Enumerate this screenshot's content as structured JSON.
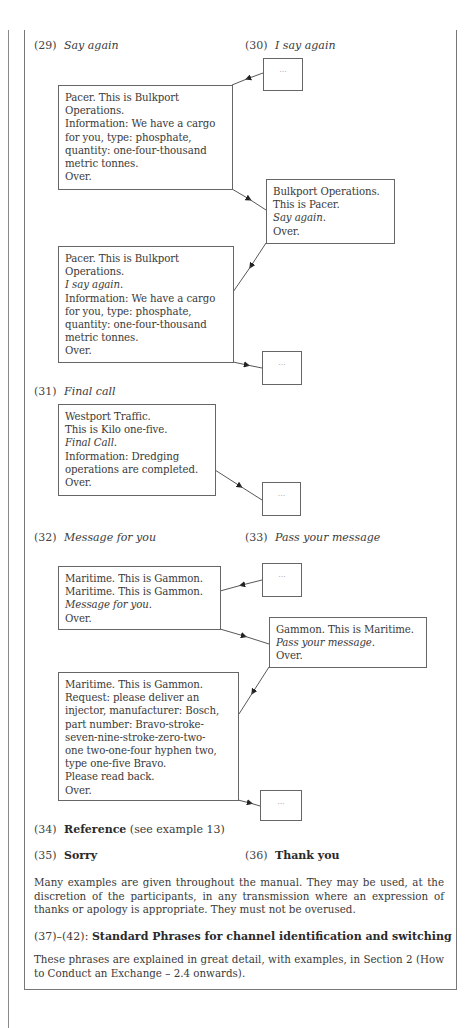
{
  "sections": {
    "s29": {
      "num": "(29)",
      "title": "Say again"
    },
    "s30": {
      "num": "(30)",
      "title": "I say again"
    },
    "s31": {
      "num": "(31)",
      "title": "Final call"
    },
    "s32": {
      "num": "(32)",
      "title": "Message for you"
    },
    "s33": {
      "num": "(33)",
      "title": "Pass your message"
    },
    "s34": {
      "num": "(34)",
      "title": "Reference",
      "note": "(see example 13)"
    },
    "s35": {
      "num": "(35)",
      "title": "Sorry"
    },
    "s36": {
      "num": "(36)",
      "title": "Thank you"
    },
    "s37": {
      "num": "(37)–(42):",
      "title": "Standard Phrases for channel identification and switching"
    }
  },
  "ellipsis": "···",
  "dialogs": {
    "say_again_1": {
      "lines": [
        "Pacer. This is Bulkport",
        "Operations.",
        "Information: We have a cargo",
        "for you, type: phosphate,",
        "quantity: one-four-thousand",
        "metric tonnes.",
        "Over."
      ]
    },
    "say_again_2": {
      "lines": [
        "Bulkport Operations.",
        "This is Pacer."
      ],
      "italic": "Say again",
      "end": "Over."
    },
    "say_again_3": {
      "lines": [
        "Pacer. This is Bulkport",
        "Operations."
      ],
      "italic": "I say again",
      "rest": [
        "Information: We have a cargo",
        "for you, type: phosphate,",
        "quantity: one-four-thousand",
        "metric tonnes.",
        "Over."
      ]
    },
    "final_call": {
      "lines": [
        "Westport Traffic.",
        "This is Kilo one-five."
      ],
      "italic": "Final Call",
      "rest": [
        "Information: Dredging",
        "operations are completed.",
        "Over."
      ]
    },
    "message_1": {
      "lines": [
        "Maritime. This is Gammon.",
        "Maritime. This is Gammon."
      ],
      "italic": "Message for you",
      "end": "Over."
    },
    "message_2": {
      "lines": [
        "Gammon. This is Maritime."
      ],
      "italic": "Pass your message",
      "end": "Over."
    },
    "message_3": {
      "lines": [
        "Maritime. This is Gammon.",
        "Request: please deliver an",
        "injector, manufacturer: Bosch,",
        "part number: Bravo-stroke-",
        "seven-nine-stroke-zero-two-",
        "one two-one-four hyphen two,",
        "type one-five Bravo.",
        "Please read back.",
        "Over."
      ]
    }
  },
  "paragraphs": {
    "thanks": "Many examples are given throughout the manual. They may be used, at the discretion of the participants, in any transmission where an expression of thanks or apology is appropriate. They must not be overused.",
    "channel": "These phrases are explained in great detail, with examples, in Section 2 (How to Conduct an Exchange – 2.4 onwards)."
  },
  "colors": {
    "text": "#3a3a3a",
    "border": "#666666",
    "rule": "#777777"
  }
}
